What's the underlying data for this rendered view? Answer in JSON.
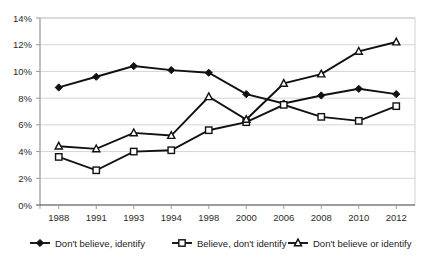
{
  "chart_data": {
    "type": "line",
    "title": "",
    "subtitle": "",
    "xlabel": "",
    "ylabel": "",
    "categories": [
      "1988",
      "1991",
      "1993",
      "1994",
      "1998",
      "2000",
      "2006",
      "2008",
      "2010",
      "2012"
    ],
    "ylim": [
      0,
      14
    ],
    "ytick_step": 2,
    "ytick_labels": [
      "0%",
      "2%",
      "4%",
      "6%",
      "8%",
      "10%",
      "12%",
      "14%"
    ],
    "ytick_values": [
      0,
      2,
      4,
      6,
      8,
      10,
      12,
      14
    ],
    "grid": true,
    "grid_axis": "y",
    "legend_position": "bottom",
    "value_suffix": "%",
    "series": [
      {
        "name": "Don't believe, identify",
        "marker": "filled-diamond",
        "color": "#111111",
        "values": [
          8.8,
          9.6,
          10.4,
          10.1,
          9.9,
          8.3,
          7.6,
          8.2,
          8.7,
          8.3
        ]
      },
      {
        "name": "Believe, don't identify",
        "marker": "open-square",
        "color": "#111111",
        "values": [
          3.6,
          2.6,
          4.0,
          4.1,
          5.6,
          6.2,
          7.5,
          6.6,
          6.3,
          7.4
        ]
      },
      {
        "name": "Don't believe or identify",
        "marker": "open-triangle",
        "color": "#111111",
        "values": [
          4.4,
          4.2,
          5.4,
          5.2,
          8.1,
          6.4,
          9.1,
          9.8,
          11.5,
          12.2
        ]
      }
    ]
  },
  "legend": {
    "items": [
      {
        "label": "Don't believe, identify",
        "marker": "filled-diamond"
      },
      {
        "label": "Believe, don't identify",
        "marker": "open-square"
      },
      {
        "label": "Don't believe or identify",
        "marker": "open-triangle"
      }
    ]
  },
  "colors": {
    "ink": "#111111",
    "grid": "#c9c9c9",
    "axis": "#9a9a9a",
    "text": "#2b2b2b",
    "background": "#ffffff"
  }
}
